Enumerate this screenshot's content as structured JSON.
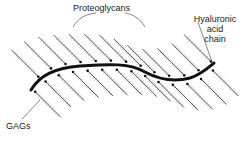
{
  "diagram": {
    "type": "proteoglycan-aggregate",
    "labels": {
      "proteoglycans": "Proteoglycans",
      "hyaluronic_line1": "Hyaluronic",
      "hyaluronic_line2": "acid",
      "hyaluronic_line3": "chain",
      "gags": "GAGs"
    },
    "colors": {
      "backbone": "#111111",
      "core_protein": "#222222",
      "gag_bristle": "#888888",
      "leader_line": "#333333",
      "background": "#ffffff"
    },
    "elements": {
      "backbone": "hyaluronic acid chain (thick S-curve)",
      "core_proteins_above": 13,
      "core_proteins_below": 14
    }
  }
}
